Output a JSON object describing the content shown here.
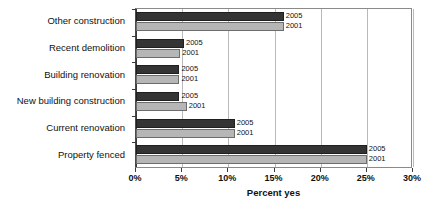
{
  "chart_data": {
    "type": "bar",
    "orientation": "horizontal",
    "title": "",
    "xlabel": "Percent yes",
    "ylabel": "",
    "xlim": [
      0,
      30
    ],
    "xticks": [
      0,
      5,
      10,
      15,
      20,
      25,
      30
    ],
    "xticklabels": [
      "0%",
      "5%",
      "10%",
      "15%",
      "20%",
      "25%",
      "30%"
    ],
    "grid": true,
    "legend": "inline-labels",
    "categories": [
      "Other construction",
      "Recent demolition",
      "Building renovation",
      "New building construction",
      "Current renovation",
      "Property fenced"
    ],
    "series": [
      {
        "name": "2005",
        "color": "#343434",
        "values": [
          16.0,
          5.2,
          4.7,
          4.7,
          10.7,
          25.0
        ]
      },
      {
        "name": "2001",
        "color": "#b6b6b6",
        "values": [
          16.0,
          4.8,
          4.7,
          5.5,
          10.7,
          25.0
        ]
      }
    ],
    "bar_labels": {
      "series_2005": [
        "2005",
        "2005",
        "2005",
        "2005",
        "2005",
        "2005"
      ],
      "series_2001": [
        "2001",
        "2001",
        "2001",
        "2001",
        "2001",
        "2001"
      ]
    }
  }
}
